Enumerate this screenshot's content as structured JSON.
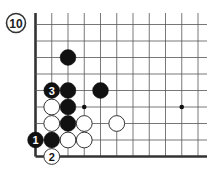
{
  "diagram": {
    "number": "10",
    "board": {
      "columns": 11,
      "rows": 9,
      "left_edge": true,
      "bottom_edge": true,
      "origin_x": 35.5,
      "origin_y": 24.5,
      "col_spacing": 16.25,
      "row_spacing": 16.5,
      "top_extend": 13,
      "right_extend": 207
    },
    "star_points": [
      {
        "col": 3,
        "row": 5
      },
      {
        "col": 9,
        "row": 5
      }
    ],
    "stones": [
      {
        "color": "black",
        "col": 2,
        "row": 2,
        "label": ""
      },
      {
        "color": "black",
        "col": 1,
        "row": 4,
        "label": "3"
      },
      {
        "color": "black",
        "col": 2,
        "row": 4,
        "label": ""
      },
      {
        "color": "black",
        "col": 4,
        "row": 4,
        "label": ""
      },
      {
        "color": "white",
        "col": 1,
        "row": 5,
        "label": ""
      },
      {
        "color": "black",
        "col": 2,
        "row": 5,
        "label": ""
      },
      {
        "color": "white",
        "col": 1,
        "row": 6,
        "label": ""
      },
      {
        "color": "black",
        "col": 2,
        "row": 6,
        "label": ""
      },
      {
        "color": "white",
        "col": 3,
        "row": 6,
        "label": ""
      },
      {
        "color": "white",
        "col": 5,
        "row": 6,
        "label": ""
      },
      {
        "color": "black",
        "col": 0,
        "row": 7,
        "label": "1"
      },
      {
        "color": "black",
        "col": 1,
        "row": 7,
        "label": ""
      },
      {
        "color": "white",
        "col": 2,
        "row": 7,
        "label": ""
      },
      {
        "color": "white",
        "col": 3,
        "row": 7,
        "label": ""
      },
      {
        "color": "white",
        "col": 1,
        "row": 8,
        "label": "2"
      }
    ],
    "colors": {
      "black_stone": "#111111",
      "white_stone": "#ffffff",
      "line": "#555555",
      "edge": "#333333"
    }
  }
}
